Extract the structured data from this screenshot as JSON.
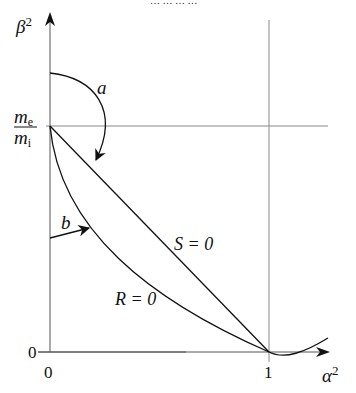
{
  "header": {
    "cut_off_text": "… … … …"
  },
  "axes": {
    "y_label_symbol": "β",
    "y_label_exp": "2",
    "x_label_symbol": "α",
    "x_label_exp": "2",
    "x_ticks": [
      "0",
      "1"
    ],
    "y_ticks": [
      "0"
    ],
    "y_ref_num": "m",
    "y_ref_num_sub": "e",
    "y_ref_den": "m",
    "y_ref_den_sub": "i"
  },
  "curves": {
    "s_label": "S = 0",
    "r_label": "R = 0"
  },
  "arrows": {
    "a_label": "a",
    "b_label": "b"
  }
}
